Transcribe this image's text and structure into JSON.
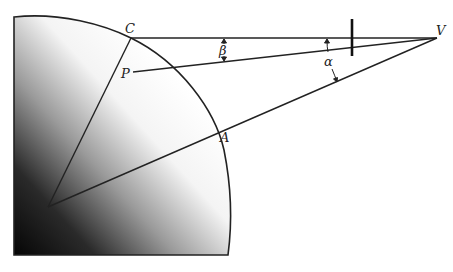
{
  "diagram": {
    "type": "geometry",
    "labels": {
      "C": "C",
      "P": "P",
      "A": "A",
      "V": "V",
      "alpha": "α",
      "beta": "β"
    },
    "points": {
      "C": [
        131,
        38
      ],
      "P": [
        133,
        72
      ],
      "A": [
        223,
        145
      ],
      "V": [
        437,
        38
      ],
      "O": [
        48,
        207
      ]
    },
    "colors": {
      "line": "#222222",
      "shade_dark": "#0a0a0a",
      "shade_light": "#ffffff",
      "background": "#ffffff"
    }
  }
}
